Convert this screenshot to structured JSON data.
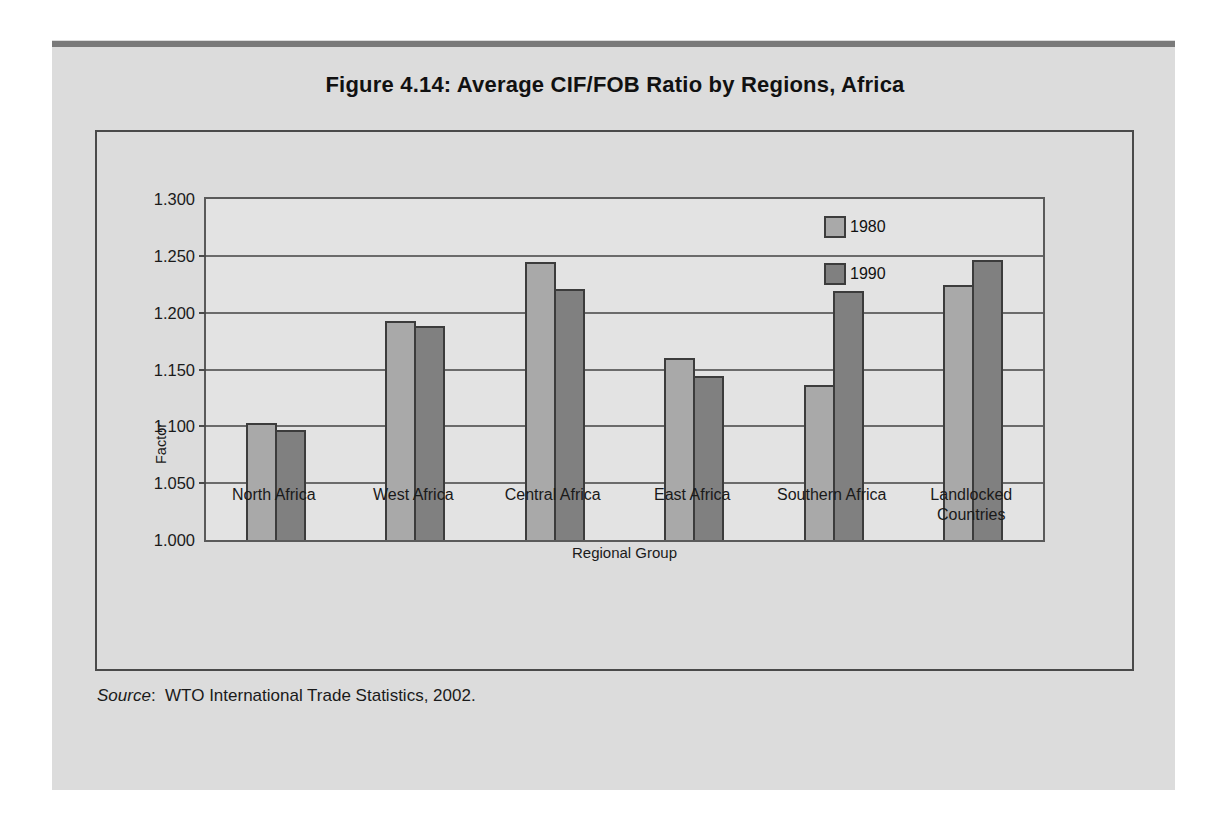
{
  "figure": {
    "title": "Figure 4.14:  Average CIF/FOB Ratio by Regions, Africa",
    "source_word": "Source",
    "source_sep": ":",
    "source_text": "WTO International Trade Statistics, 2002."
  },
  "colors": {
    "series_1980": "#a9a9a9",
    "series_1990": "#808080",
    "bar_outline": "#3c3c3c",
    "plot_background": "#e3e3e3",
    "paper_background": "#dcdcdc",
    "top_rule": "#7a7a7a",
    "gridline": "#6b6b6b"
  },
  "chart_data": {
    "type": "bar",
    "title": "Figure 4.14:  Average CIF/FOB Ratio by Regions, Africa",
    "xlabel": "Regional Group",
    "ylabel": "Factor",
    "ylim": [
      1.0,
      1.3
    ],
    "ytick_step": 0.05,
    "ytick_labels": [
      "1.300",
      "1.250",
      "1.200",
      "1.150",
      "1.100",
      "1.050",
      "1.000"
    ],
    "ytick_values": [
      1.3,
      1.25,
      1.2,
      1.15,
      1.1,
      1.05,
      1.0
    ],
    "grid": true,
    "legend_position": "inside-top-center",
    "categories": [
      "North Africa",
      "West Africa",
      "Central Africa",
      "East Africa",
      "Southern Africa",
      "Landlocked Countries"
    ],
    "category_lines": [
      [
        "North Africa"
      ],
      [
        "West Africa"
      ],
      [
        "Central Africa"
      ],
      [
        "East Africa"
      ],
      [
        "Southern Africa"
      ],
      [
        "Landlocked",
        "Countries"
      ]
    ],
    "series": [
      {
        "name": "1980",
        "values": [
          1.103,
          1.193,
          1.245,
          1.16,
          1.136,
          1.224
        ]
      },
      {
        "name": "1990",
        "values": [
          1.097,
          1.188,
          1.221,
          1.144,
          1.219,
          1.246
        ]
      }
    ]
  }
}
